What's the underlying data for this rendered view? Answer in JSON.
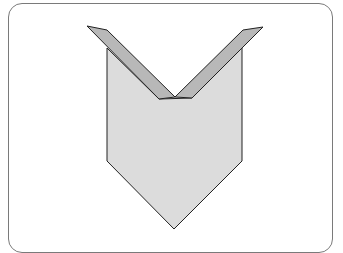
{
  "diagram": {
    "colors": {
      "body_fill": "#dcdcdc",
      "flap_fill": "#b8b8b8",
      "outline": "#222222",
      "frame": "#7a7a7a"
    },
    "parts": [
      {
        "name": "body",
        "label": "folded body"
      },
      {
        "name": "left-flap",
        "label": "left folded flap"
      },
      {
        "name": "right-flap",
        "label": "right folded flap"
      }
    ]
  }
}
